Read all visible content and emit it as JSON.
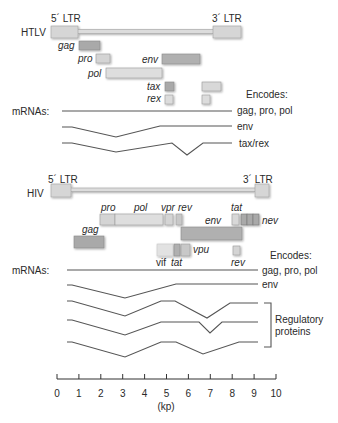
{
  "colors": {
    "light_box": "#dcdcdc",
    "mid_box": "#c8c8c8",
    "dark_box": "#a9a9a9",
    "box_edge": "#9a9a9a",
    "line": "#555555",
    "text": "#2a2a2a"
  },
  "htlv": {
    "name": "HTLV",
    "ltr5": "5´ LTR",
    "ltr3": "3´ LTR",
    "genes": {
      "gag": "gag",
      "pro": "pro",
      "pol": "pol",
      "env": "env",
      "tax": "tax",
      "rex": "rex"
    },
    "encodes_label": "Encodes:",
    "mrnas_label": "mRNAs:",
    "mrnas": [
      {
        "encodes": "gag, pro, pol"
      },
      {
        "encodes": "env"
      },
      {
        "encodes": "tax/rex"
      }
    ]
  },
  "hiv": {
    "name": "HIV",
    "ltr5": "5´ LTR",
    "ltr3": "3´ LTR",
    "genes": {
      "pro": "pro",
      "pol": "pol",
      "vpr": "vpr",
      "rev": "rev",
      "tat": "tat",
      "nev": "nev",
      "env": "env",
      "gag": "gag",
      "vif": "vif",
      "tat2": "tat",
      "vpu": "vpu",
      "rev2": "rev"
    },
    "encodes_label": "Encodes:",
    "mrnas_label": "mRNAs:",
    "mrnas": [
      {
        "encodes": "gag, pro, pol"
      },
      {
        "encodes": "env"
      },
      {
        "encodes": ""
      },
      {
        "encodes": ""
      },
      {
        "encodes": ""
      }
    ],
    "bracket_label_1": "Regulatory",
    "bracket_label_2": "proteins"
  },
  "axis": {
    "ticks": [
      "0",
      "1",
      "2",
      "3",
      "4",
      "5",
      "6",
      "7",
      "8",
      "9",
      "10"
    ],
    "unit": "(kp)",
    "range": [
      0,
      10
    ]
  }
}
